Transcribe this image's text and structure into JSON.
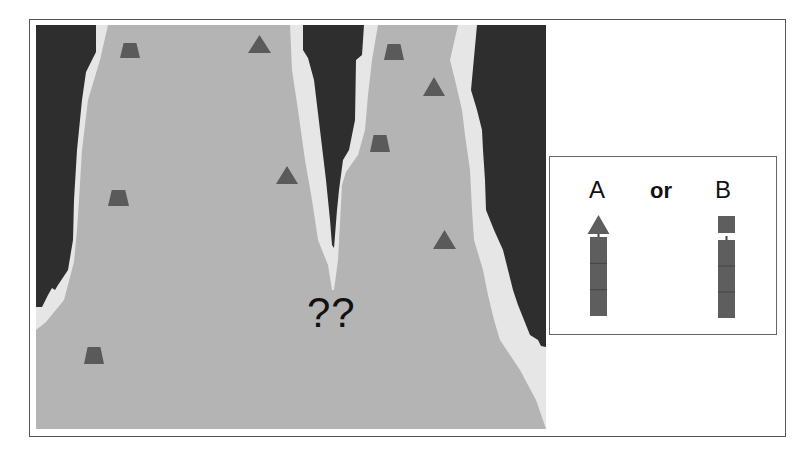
{
  "colors": {
    "background": "#ffffff",
    "frame_border": "#555555",
    "dark_region": "#2e2e2e",
    "light_border": "#e6e6e6",
    "main_region": "#b4b4b4",
    "marker": "#5a5a5a",
    "stack_fill": "#5e5e5e",
    "stack_line": "#444444"
  },
  "scene": {
    "main_area": {
      "x": 36,
      "y": 25,
      "width": 510,
      "height": 404
    },
    "regions": {
      "light_left": "36,25 108,25 100,60 88,100 82,150 79,200 77,230 74,262 64,300 46,322 36,330",
      "dark_left": "36,25 96,25 96,52 86,72 82,100 77,150 74,200 73,240 68,270 58,285 55,290 52,288 48,295 42,307 36,307",
      "light_mid": "290,25 378,25 372,60 368,95 365,130 358,155 346,172 342,185 338,260 334,290 332,290 328,265 318,240 312,200 305,160 298,110 292,70",
      "dark_mid": "303,25 364,25 362,55 356,60 355,120 349,150 343,160 341,175 339,190 337,210 334,248 332,245 330,220 326,180 320,130 314,80 308,58 303,50",
      "light_right": "458,25 546,25 546,429 536,400 520,370 500,340 494,320 488,295 483,270 474,240 472,210 470,170 465,135 462,110 455,80 450,60",
      "dark_right": "477,25 546,25 546,347 541,346 538,340 530,335 524,320 518,305 513,290 508,270 503,250 494,230 486,210 485,180 483,150 482,130 477,110 471,90",
      "main_gray": "36,25 36,429 546,429 536,400 520,370 500,340 494,320 488,295 483,270 474,240 472,210 470,170 465,135 462,110 455,80 450,60 458,25 378,25 372,60 368,95 365,130 358,155 346,172 342,185 338,260 334,290 332,290 328,265 318,240 312,200 305,160 298,110 292,70 290,25 108,25 100,60 88,100 82,150 79,200 77,230 74,262 64,300 46,322 36,330"
    },
    "triangles": [
      {
        "x": 248,
        "y": 35,
        "w": 23,
        "h": 18
      },
      {
        "x": 423,
        "y": 77,
        "w": 22,
        "h": 19
      },
      {
        "x": 276,
        "y": 166,
        "w": 22,
        "h": 18
      },
      {
        "x": 433,
        "y": 230,
        "w": 23,
        "h": 19
      }
    ],
    "trapezoids": [
      {
        "x": 120,
        "y": 43,
        "w": 20,
        "h": 15
      },
      {
        "x": 384,
        "y": 44,
        "w": 20,
        "h": 16
      },
      {
        "x": 370,
        "y": 135,
        "w": 20,
        "h": 17
      },
      {
        "x": 108,
        "y": 190,
        "w": 21,
        "h": 16
      },
      {
        "x": 84,
        "y": 347,
        "w": 20,
        "h": 17
      }
    ],
    "question_text": "??"
  },
  "panel": {
    "option_a_label": "A",
    "connector_label": "or",
    "option_b_label": "B",
    "option_a": {
      "top_shape": "triangle",
      "stack": {
        "x": 40,
        "y": 80,
        "w": 17,
        "h": 79,
        "segments": 3
      }
    },
    "option_b": {
      "top_shape": "square",
      "stack": {
        "x": 168,
        "y": 83,
        "w": 17,
        "h": 78,
        "segments": 3
      }
    }
  }
}
